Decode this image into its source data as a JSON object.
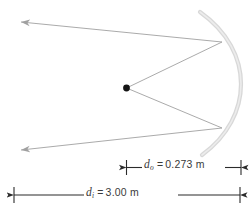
{
  "figure": {
    "background_color": "#ffffff",
    "width": 251,
    "height": 216
  },
  "optics": {
    "mirror": {
      "name": "concave-mirror-arc",
      "color": "#d5d5d5"
    },
    "object_point": {
      "name": "object-point",
      "color": "#141414"
    },
    "rays": {
      "color": "#a8a8a8",
      "count": 4
    }
  },
  "dimensions": [
    {
      "id": "object-distance",
      "symbol": "d",
      "subscript": "o",
      "equals": "=",
      "value": "0.273",
      "unit": "m",
      "text": "d_o = 0.273 m"
    },
    {
      "id": "image-distance",
      "symbol": "d",
      "subscript": "i",
      "equals": "=",
      "value": "3.00",
      "unit": "m",
      "text": "d_i = 3.00 m"
    }
  ],
  "dimension_line_color": "#2b2b2b"
}
